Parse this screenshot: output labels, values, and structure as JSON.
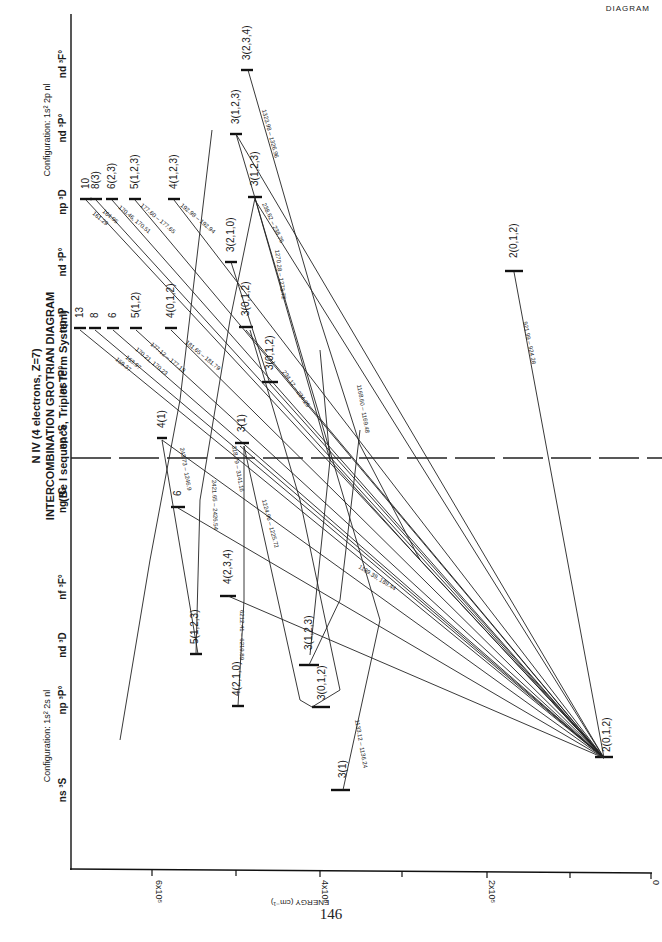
{
  "page": {
    "corner_label": "DIAGRAM",
    "page_number": "146"
  },
  "title": {
    "line1": "N IV (4 electrons, Z=7)",
    "line1_roman": "IV",
    "line2": "INTERCOMBINATION GROTRIAN DIAGRAM",
    "line3": "(Be I sequence, Triplet Term System)"
  },
  "columns": {
    "config_1s2_2snl": {
      "label": "Configuration: 1s² 2s nl",
      "terms": [
        "ns ³S",
        "np ³P°",
        "nd ³D",
        "nf ³F°",
        "ng ³G"
      ]
    },
    "config_1s2_2pnl": {
      "label": "Configuration: 1s² 2p nl",
      "terms": [
        "np ³S",
        "ns ³P°",
        "np ³P",
        "nd ³P°",
        "np ³D",
        "nd ³P°",
        "nd ³F°"
      ]
    }
  },
  "axis": {
    "title": "ENERGY (cm⁻¹)",
    "ticks": [
      "6x10⁵",
      "4x10⁵",
      "2x10⁵",
      "0"
    ]
  },
  "levels": [
    {
      "label": "2(0,1,2)",
      "column": "np 3P° (2s)"
    },
    {
      "label": "3(1)",
      "column": "ns 3S"
    },
    {
      "label": "3(0,1,2)",
      "column": "np 3P°"
    },
    {
      "label": "4(2,1,0)",
      "column": "np 3P°"
    },
    {
      "label": "3(1,2,3)",
      "column": "nd 3D"
    },
    {
      "label": "5(1,2,3)",
      "column": "nd 3D"
    },
    {
      "label": "4(2,3,4)",
      "column": "nf 3F°"
    },
    {
      "label": "6",
      "column": "ng 3G"
    },
    {
      "label": "4(1)",
      "column": "np 3S"
    },
    {
      "label": "3(1)",
      "column": "np 3S"
    },
    {
      "label": "3(0,1,2)",
      "column": "ns 3P°"
    },
    {
      "label": "13",
      "column": "np 3P"
    },
    {
      "label": "8",
      "column": "np 3P"
    },
    {
      "label": "6",
      "column": "np 3P"
    },
    {
      "label": "5(1,2)",
      "column": "np 3P"
    },
    {
      "label": "4(0,1,2)",
      "column": "np 3P"
    },
    {
      "label": "3(0,1,2)",
      "column": "np 3P"
    },
    {
      "label": "2(0,1,2)",
      "column": "np 3P (2p2)"
    },
    {
      "label": "3(2,1,0)",
      "column": "nd 3P°"
    },
    {
      "label": "10",
      "column": "np 3D"
    },
    {
      "label": "8(3)",
      "column": "np 3D"
    },
    {
      "label": "6(2,3)",
      "column": "np 3D"
    },
    {
      "label": "5(1,2,3)",
      "column": "np 3D"
    },
    {
      "label": "4(1,2,3)",
      "column": "np 3D"
    },
    {
      "label": "3(1,2,3)",
      "column": "np 3D"
    },
    {
      "label": "3(1,2,3)",
      "column": "nd 3P° (upper)"
    },
    {
      "label": "3(2,3,4)",
      "column": "nd 3F°"
    }
  ],
  "transitions": [
    "159.37",
    "163.97",
    "170.21, 170.23",
    "177.12 – 177.18",
    "181.65 – 181.79",
    "161.29",
    "164.05",
    "170.46, 170.51",
    "177.60 – 177.65",
    "192.98 – 192.94",
    "243.73 – 1246.9",
    "318.79 – 3141.16",
    "2421.65 – 2426.54",
    "6212.41 – 6219.89",
    "1224.96 – 1225.72",
    "1270.28 – 1273.72",
    "238.62 – 238.76",
    "1323.98 – 1326.96",
    "234.12 – 234.25",
    "1168.60 – 1169.48",
    "1133.12 – 1136.24",
    "1189.39, 189.44",
    "921.99 – 924.28"
  ]
}
